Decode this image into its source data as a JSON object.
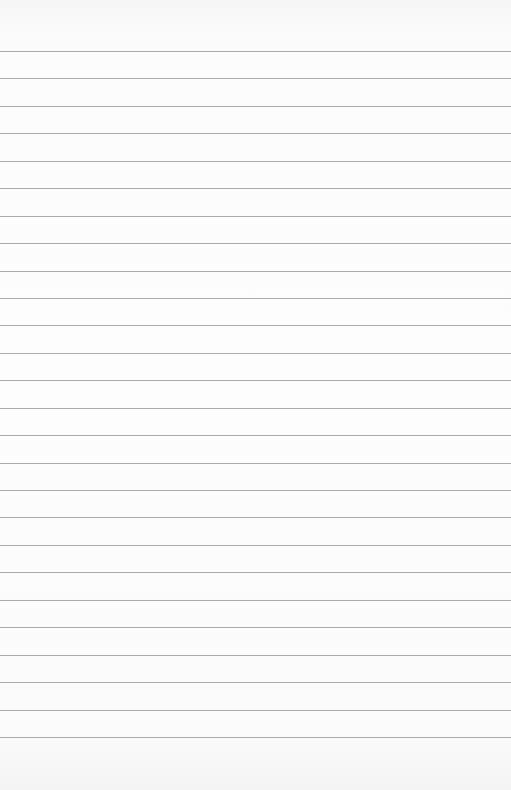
{
  "paper": {
    "type": "lined-sheet",
    "background_color": "#fbfbfb",
    "line_color": "#9c9c9c",
    "line_count": 26,
    "first_line_y": 51,
    "line_spacing": 27.44
  }
}
